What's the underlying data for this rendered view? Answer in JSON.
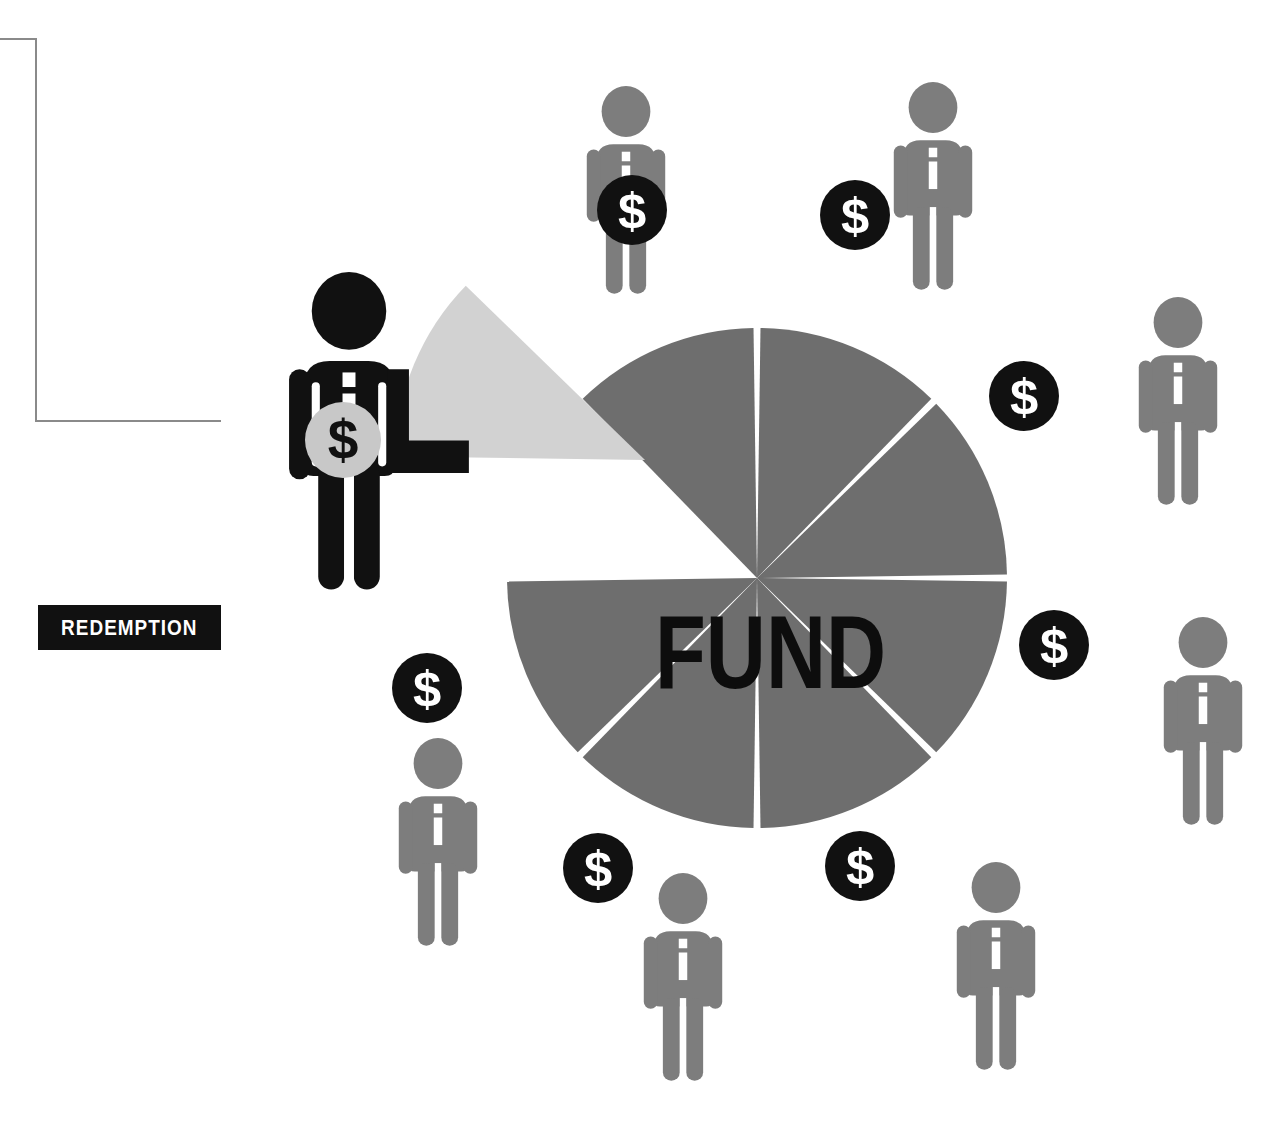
{
  "canvas": {
    "width": 1261,
    "height": 1127,
    "background": "#ffffff"
  },
  "labels": {
    "redemption": "REDEMPTION",
    "fund": "FUND"
  },
  "colors": {
    "pie_slice": "#6e6e6e",
    "pie_exploded_slice": "#d2d2d2",
    "investor_figure": "#7d7d7d",
    "redeeming_figure": "#111111",
    "coin_dark": "#111111",
    "coin_light": "#c8c8c8",
    "coin_symbol_light": "#ffffff",
    "coin_symbol_dark": "#111111",
    "label_background": "#111111",
    "label_text": "#ffffff",
    "bracket_line": "#8a8a8a",
    "gap": "#ffffff"
  },
  "coin": {
    "symbol": "$"
  },
  "bracket": {
    "vertical": {
      "x": 35,
      "y": 38,
      "height": 384
    },
    "top": {
      "x": 0,
      "y": 38,
      "width": 37
    },
    "bottom": {
      "x": 35,
      "y": 420,
      "width": 186
    }
  },
  "redemption_label": {
    "x": 38,
    "y": 605,
    "width": 183,
    "height": 45
  },
  "chart_data": {
    "type": "pie",
    "title": "FUND",
    "center": {
      "x": 757,
      "y": 578
    },
    "radius": 250,
    "gap_degrees": 1.6,
    "legend": "none",
    "grid": false,
    "categories": [
      "Slice 1",
      "Slice 2",
      "Slice 3",
      "Slice 4",
      "Slice 5",
      "Slice 6",
      "Slice 7",
      "Slice 8 (redeemed)"
    ],
    "values": [
      12.5,
      12.5,
      12.5,
      12.5,
      12.5,
      12.5,
      12.5,
      12.5
    ],
    "slices": [
      {
        "name": "Slice 1",
        "start_deg": 90,
        "end_deg": 135,
        "color": "#6e6e6e",
        "exploded": false
      },
      {
        "name": "Slice 2",
        "start_deg": 45,
        "end_deg": 90,
        "color": "#6e6e6e",
        "exploded": false
      },
      {
        "name": "Slice 3",
        "start_deg": 0,
        "end_deg": 45,
        "color": "#6e6e6e",
        "exploded": false
      },
      {
        "name": "Slice 4",
        "start_deg": -45,
        "end_deg": 0,
        "color": "#6e6e6e",
        "exploded": false
      },
      {
        "name": "Slice 5",
        "start_deg": -90,
        "end_deg": -45,
        "color": "#6e6e6e",
        "exploded": false
      },
      {
        "name": "Slice 6",
        "start_deg": -135,
        "end_deg": -90,
        "color": "#6e6e6e",
        "exploded": false
      },
      {
        "name": "Slice 7",
        "start_deg": 180,
        "end_deg": -135,
        "color": "#6e6e6e",
        "exploded": false
      },
      {
        "name": "Slice 8 (redeemed)",
        "start_deg": 135,
        "end_deg": 180,
        "color": "#d2d2d2",
        "exploded": true,
        "offset": {
          "dx": -112,
          "dy": -118
        }
      }
    ]
  },
  "redeeming_investor": {
    "role": "redeeming-investor",
    "x": 268,
    "y": 272,
    "scale": 1.62,
    "color": "#111111",
    "arm_extended": "right",
    "coin": {
      "x": 343,
      "y": 440,
      "r": 38,
      "fill": "#c8c8c8",
      "symbol_color": "#111111"
    }
  },
  "investors": [
    {
      "id": "investor-top-left",
      "x": 573,
      "y": 86,
      "scale": 1.06,
      "coin": {
        "x": 632,
        "y": 210,
        "r": 35
      }
    },
    {
      "id": "investor-top-right",
      "x": 880,
      "y": 82,
      "scale": 1.06,
      "coin": {
        "x": 855,
        "y": 215,
        "r": 35
      }
    },
    {
      "id": "investor-right-upper",
      "x": 1125,
      "y": 297,
      "scale": 1.06,
      "coin": {
        "x": 1024,
        "y": 396,
        "r": 35
      }
    },
    {
      "id": "investor-right-lower",
      "x": 1150,
      "y": 617,
      "scale": 1.06,
      "coin": {
        "x": 1054,
        "y": 645,
        "r": 35
      }
    },
    {
      "id": "investor-bottom-right",
      "x": 943,
      "y": 862,
      "scale": 1.06,
      "coin": {
        "x": 860,
        "y": 866,
        "r": 35
      }
    },
    {
      "id": "investor-bottom-left",
      "x": 630,
      "y": 873,
      "scale": 1.06,
      "coin": {
        "x": 598,
        "y": 868,
        "r": 35
      }
    },
    {
      "id": "investor-left-lower",
      "x": 385,
      "y": 738,
      "scale": 1.06,
      "coin": {
        "x": 427,
        "y": 688,
        "r": 35
      }
    }
  ]
}
